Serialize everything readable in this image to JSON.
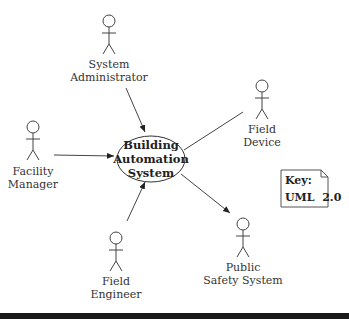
{
  "diagram": {
    "type": "uml-use-case",
    "use_case": {
      "lines": [
        "Building",
        "Automation",
        "System"
      ]
    },
    "actors": [
      {
        "id": "system-administrator",
        "lines": [
          "System",
          "Administrator"
        ]
      },
      {
        "id": "field-device",
        "lines": [
          "Field",
          "Device"
        ]
      },
      {
        "id": "facility-manager",
        "lines": [
          "Facility",
          "Manager"
        ]
      },
      {
        "id": "field-engineer",
        "lines": [
          "Field",
          "Engineer"
        ]
      },
      {
        "id": "public-safety-system",
        "lines": [
          "Public",
          "Safety System"
        ]
      }
    ],
    "associations": [
      {
        "from": "System Administrator",
        "to": "Building Automation System",
        "arrow": "to-use-case"
      },
      {
        "from": "Facility Manager",
        "to": "Building Automation System",
        "arrow": "to-use-case"
      },
      {
        "from": "Field Engineer",
        "to": "Building Automation System",
        "arrow": "to-use-case"
      },
      {
        "from": "Building Automation System",
        "to": "Public Safety System",
        "arrow": "to-actor"
      },
      {
        "from": "Building Automation System",
        "to": "Field Device",
        "arrow": "none"
      }
    ],
    "key": {
      "title": "Key:",
      "value": "UML  2.0"
    }
  }
}
